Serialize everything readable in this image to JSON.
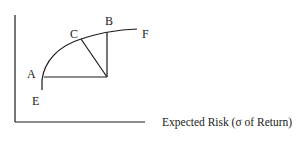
{
  "diagram": {
    "x_axis_label": "Expected Risk (σ of Return)",
    "points": {
      "A": "A",
      "B": "B",
      "C": "C",
      "E": "E",
      "F": "F"
    },
    "colors": {
      "line": "#1a1a1a",
      "background": "#ffffff"
    }
  }
}
